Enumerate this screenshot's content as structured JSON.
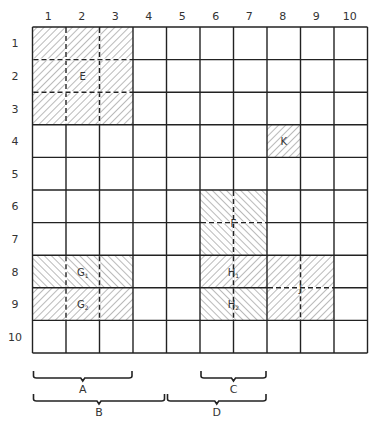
{
  "diagram": {
    "title": "",
    "grid": {
      "rows": 10,
      "cols": 10
    },
    "column_labels": [
      "1",
      "2",
      "3",
      "4",
      "5",
      "6",
      "7",
      "8",
      "9",
      "10"
    ],
    "row_labels": [
      "1",
      "2",
      "3",
      "4",
      "5",
      "6",
      "7",
      "8",
      "9",
      "10"
    ],
    "regions": [
      {
        "id": "E",
        "label": "E",
        "sub": "",
        "rows": [
          1,
          3
        ],
        "cols": [
          1,
          3
        ],
        "hatch": "forward",
        "dashed_internal": true
      },
      {
        "id": "K",
        "label": "K",
        "sub": "",
        "rows": [
          4,
          4
        ],
        "cols": [
          8,
          8
        ],
        "hatch": "forward",
        "dashed_internal": false
      },
      {
        "id": "F",
        "label": "F",
        "sub": "",
        "rows": [
          6,
          7
        ],
        "cols": [
          6,
          7
        ],
        "hatch": "backward",
        "dashed_internal": true
      },
      {
        "id": "G1",
        "label": "G",
        "sub": "1",
        "rows": [
          8,
          8
        ],
        "cols": [
          1,
          3
        ],
        "hatch": "backward",
        "dashed_internal": true
      },
      {
        "id": "G2",
        "label": "G",
        "sub": "2",
        "rows": [
          9,
          9
        ],
        "cols": [
          1,
          3
        ],
        "hatch": "forward",
        "dashed_internal": true
      },
      {
        "id": "H1",
        "label": "H",
        "sub": "1",
        "rows": [
          8,
          8
        ],
        "cols": [
          6,
          7
        ],
        "hatch": "forward",
        "dashed_internal": true
      },
      {
        "id": "H2",
        "label": "H",
        "sub": "2",
        "rows": [
          9,
          9
        ],
        "cols": [
          6,
          7
        ],
        "hatch": "backward",
        "dashed_internal": true
      },
      {
        "id": "J",
        "label": "J",
        "sub": "",
        "rows": [
          8,
          9
        ],
        "cols": [
          8,
          9
        ],
        "hatch": "forward",
        "dashed_internal": true
      }
    ],
    "brackets": [
      {
        "id": "A",
        "label": "A",
        "cols": [
          1,
          3
        ],
        "level": 1
      },
      {
        "id": "C",
        "label": "C",
        "cols": [
          6,
          7
        ],
        "level": 1
      },
      {
        "id": "B",
        "label": "B",
        "cols": [
          1,
          4
        ],
        "level": 2
      },
      {
        "id": "D",
        "label": "D",
        "cols": [
          5,
          7
        ],
        "level": 2
      }
    ],
    "colors": {
      "line": "#222222",
      "hatch": "#555555",
      "background": "#ffffff"
    }
  }
}
